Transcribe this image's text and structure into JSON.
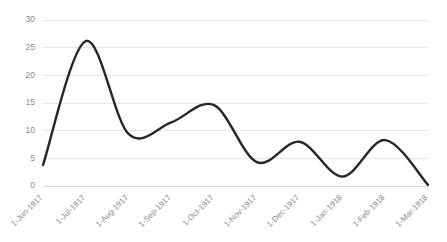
{
  "chart_data": {
    "type": "line",
    "title": "",
    "subtitle": "",
    "xlabel": "",
    "ylabel": "",
    "categories": [
      "1-Jun-1917",
      "1-Jul-1917",
      "1-Aug-1917",
      "1-Sep-1917",
      "1-Oct-1917",
      "1-Nov-1917",
      "1-Dec-1917",
      "1-Jan-1918",
      "1-Feb-1918",
      "1-Mar-1918"
    ],
    "values": [
      3.8,
      26.2,
      9.4,
      11.5,
      14.6,
      4.3,
      8.0,
      1.7,
      8.3,
      0.2
    ],
    "series": [
      {
        "name": "Series 1",
        "values": [
          3.8,
          26.2,
          9.4,
          11.5,
          14.6,
          4.3,
          8.0,
          1.7,
          8.3,
          0.2
        ]
      }
    ],
    "ylim": [
      0,
      30
    ],
    "yticks": [
      0,
      5,
      10,
      15,
      20,
      25,
      30
    ],
    "ytick_labels": [
      "0",
      "5",
      "10",
      "15",
      "20",
      "25",
      "30"
    ],
    "grid": "horizontal",
    "legend": "none",
    "smoothing": "spline",
    "markers": "none",
    "xtick_rotation_deg": 45,
    "line_color": "#262626",
    "gridline_color": "#e6e6e6",
    "tick_label_color": "#8a8a8a",
    "background_color": "#ffffff"
  }
}
